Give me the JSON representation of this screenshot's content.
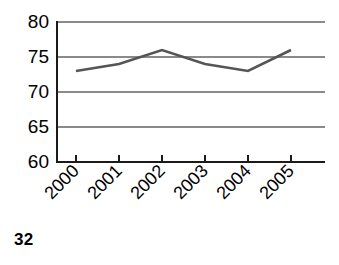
{
  "page": {
    "page_number": "32",
    "background_color": "#ffffff"
  },
  "chart_data": {
    "type": "line",
    "title": "",
    "subtitle": "",
    "xlabel": "",
    "ylabel": "",
    "categories": [
      "2000",
      "2001",
      "2002",
      "2003",
      "2004",
      "2005"
    ],
    "values": [
      73,
      74,
      76,
      74,
      73,
      76
    ],
    "series": [
      {
        "name": "",
        "values": [
          73,
          74,
          76,
          74,
          73,
          76
        ],
        "color": "#555555"
      }
    ],
    "ylim": [
      60,
      80
    ],
    "yticks": [
      60,
      65,
      70,
      75,
      80
    ],
    "ytick_labels": [
      "60",
      "65",
      "70",
      "75",
      "80"
    ],
    "xtick_labels": [
      "2000",
      "2001",
      "2002",
      "2003",
      "2004",
      "2005"
    ],
    "xtick_rotation": 45,
    "grid": true,
    "grid_axis": "y",
    "grid_color": "#8a8a8a",
    "legend": false,
    "legend_position": "none",
    "markers": false,
    "axis_color": "#1a1a1a",
    "annotations": []
  },
  "axes": {
    "y_labels": [
      "80",
      "75",
      "70",
      "65",
      "60"
    ],
    "x_labels": [
      "2000",
      "2001",
      "2002",
      "2003",
      "2004",
      "2005"
    ]
  }
}
